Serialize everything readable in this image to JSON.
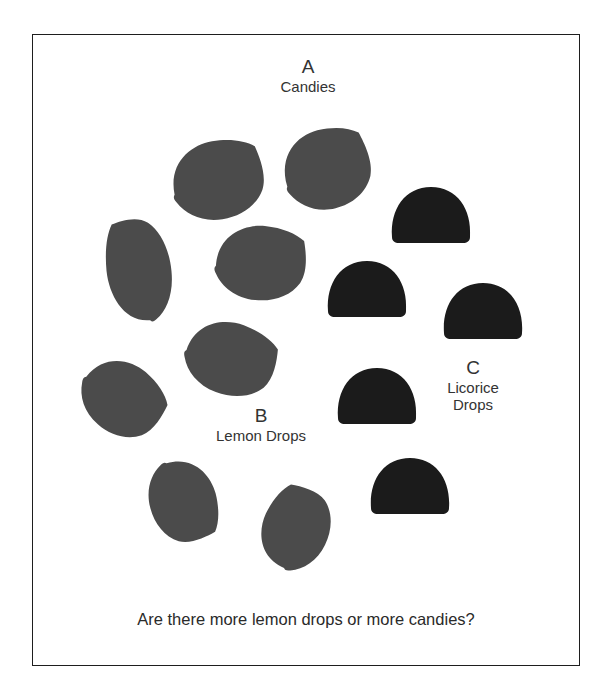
{
  "figure": {
    "groups": [
      {
        "letter": "A",
        "name": "Candies"
      },
      {
        "letter": "B",
        "name": "Lemon Drops"
      },
      {
        "letter": "C",
        "name_line1": "Licorice",
        "name_line2": "Drops"
      }
    ],
    "question": "Are there more lemon drops or more candies?",
    "counts": {
      "lemon_drops": 8,
      "licorice_drops": 5,
      "candies": 13
    },
    "colors": {
      "lemon_drop": "#4b4b4b",
      "licorice_drop": "#1b1b1b",
      "border": "#1e1e1e",
      "background": "#ffffff"
    }
  }
}
